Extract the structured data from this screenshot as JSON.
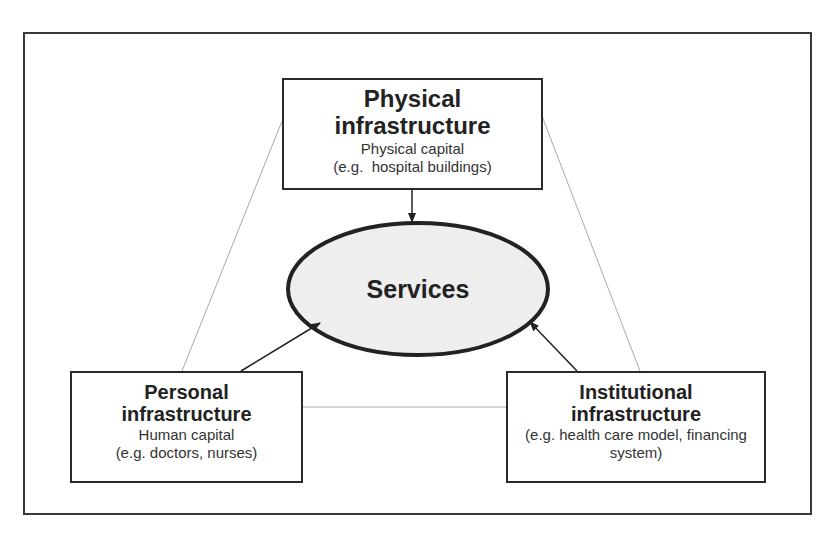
{
  "diagram": {
    "physical": {
      "title_line1": "Physical",
      "title_line2": "infrastructure",
      "subtitle": "Physical capital",
      "example": "(e.g.  hospital buildings)"
    },
    "services": {
      "label": "Services",
      "fill": "#eeeeee"
    },
    "personal": {
      "title_line1": "Personal",
      "title_line2": "infrastructure",
      "subtitle": "Human capital",
      "example": "(e.g. doctors, nurses)"
    },
    "institutional": {
      "title_line1": "Institutional",
      "title_line2": "infrastructure",
      "example_line1": "(e.g. health care model, financing",
      "example_line2": "system)"
    },
    "colors": {
      "stroke": "#222222",
      "thin_line": "#aaaaaa"
    }
  }
}
